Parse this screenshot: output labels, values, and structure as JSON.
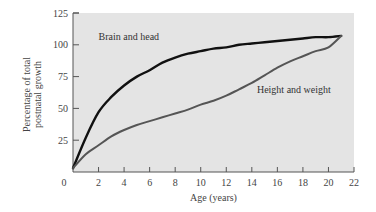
{
  "chart_data": {
    "type": "line",
    "title": "",
    "xlabel": "Age (years)",
    "ylabel": "Percentage of total postnatal growth",
    "ylabel_lines": [
      "Percentage of total",
      "postnatal growth"
    ],
    "xlim": [
      0,
      22
    ],
    "ylim": [
      0,
      125
    ],
    "x_ticks": [
      0,
      2,
      4,
      6,
      8,
      10,
      12,
      14,
      16,
      18,
      20,
      22
    ],
    "y_ticks": [
      0,
      25,
      50,
      75,
      100,
      125
    ],
    "grid": false,
    "legend": "inline annotations",
    "colors": {
      "plot_background": "#e4e4e4",
      "brain": "#111111",
      "height": "#555555",
      "axis": "#555555"
    },
    "series": [
      {
        "name": "Brain and head",
        "x": [
          0,
          1,
          2,
          3,
          4,
          5,
          6,
          7,
          8,
          9,
          10,
          11,
          12,
          13,
          14,
          15,
          16,
          17,
          18,
          19,
          20,
          21
        ],
        "values": [
          3,
          27,
          47,
          59,
          68,
          75,
          80,
          86,
          90,
          93,
          95,
          97,
          98,
          100,
          101,
          102,
          103,
          104,
          105,
          106,
          106,
          107
        ]
      },
      {
        "name": "Height and weight",
        "x": [
          0,
          1,
          2,
          3,
          4,
          5,
          6,
          7,
          8,
          9,
          10,
          11,
          12,
          13,
          14,
          15,
          16,
          17,
          18,
          19,
          20,
          21
        ],
        "values": [
          3,
          14,
          21,
          28,
          33,
          37,
          40,
          43,
          46,
          49,
          53,
          56,
          60,
          65,
          70,
          76,
          82,
          87,
          91,
          95,
          98,
          107
        ]
      }
    ],
    "annotations": [
      {
        "text": "Brain and head",
        "x": 2,
        "y": 104
      },
      {
        "text": "Height and weight",
        "x": 14.4,
        "y": 62
      }
    ]
  }
}
